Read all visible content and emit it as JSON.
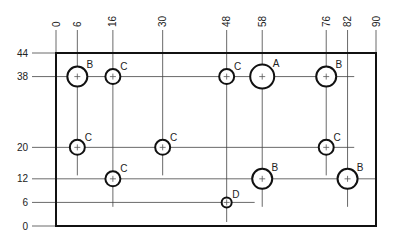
{
  "diagram": {
    "type": "hole-location drawing (plate with rectangular coordinate dimensioning)",
    "plate": {
      "x_min": 0,
      "x_max": 90,
      "y_min": 0,
      "y_max": 44
    },
    "x_dimensions": [
      0,
      6,
      16,
      30,
      48,
      58,
      76,
      82,
      90
    ],
    "y_dimensions": [
      44,
      38,
      20,
      12,
      6,
      0
    ],
    "x_dimension_labels": [
      "0",
      "6",
      "16",
      "30",
      "48",
      "58",
      "76",
      "82",
      "90"
    ],
    "y_dimension_labels": [
      "44",
      "38",
      "20",
      "12",
      "6",
      "0"
    ],
    "hole_sizes": {
      "A": {
        "radius_px": 12
      },
      "B": {
        "radius_px": 10
      },
      "C": {
        "radius_px": 7.5
      },
      "D": {
        "radius_px": 5
      }
    },
    "holes": [
      {
        "label": "B",
        "x": 6,
        "y": 38
      },
      {
        "label": "C",
        "x": 16,
        "y": 38
      },
      {
        "label": "C",
        "x": 48,
        "y": 38
      },
      {
        "label": "A",
        "x": 58,
        "y": 38
      },
      {
        "label": "B",
        "x": 76,
        "y": 38
      },
      {
        "label": "C",
        "x": 6,
        "y": 20
      },
      {
        "label": "C",
        "x": 30,
        "y": 20
      },
      {
        "label": "C",
        "x": 76,
        "y": 20
      },
      {
        "label": "C",
        "x": 16,
        "y": 12
      },
      {
        "label": "B",
        "x": 58,
        "y": 12
      },
      {
        "label": "B",
        "x": 82,
        "y": 12
      },
      {
        "label": "D",
        "x": 48,
        "y": 6
      }
    ],
    "colors": {
      "line": "#111111",
      "thin_line": "#333333",
      "background": "#ffffff"
    }
  }
}
